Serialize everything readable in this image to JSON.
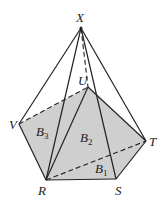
{
  "diagram": {
    "type": "pyramid-pentagonal-base",
    "fill_color": "#cfcfcf",
    "line_color": "#222222",
    "vertices": {
      "X": {
        "label": "X",
        "x": 81,
        "y": 28
      },
      "U": {
        "label": "U",
        "x": 88,
        "y": 87
      },
      "V": {
        "label": "V",
        "x": 19,
        "y": 124
      },
      "T": {
        "label": "T",
        "x": 146,
        "y": 141
      },
      "R": {
        "label": "R",
        "x": 46,
        "y": 180
      },
      "S": {
        "label": "S",
        "x": 116,
        "y": 179
      }
    },
    "regions": [
      {
        "label": "B",
        "sub": "1"
      },
      {
        "label": "B",
        "sub": "2"
      },
      {
        "label": "B",
        "sub": "3"
      }
    ]
  }
}
